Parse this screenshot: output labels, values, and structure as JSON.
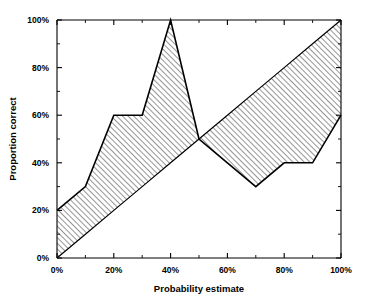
{
  "chart_data": {
    "type": "area",
    "title": "",
    "subtitle": "",
    "xlabel": "Probability estimate",
    "ylabel": "Proportion correct",
    "xlim": [
      0,
      100
    ],
    "ylim": [
      0,
      100
    ],
    "grid": false,
    "legend": "none",
    "x_tick_labels": [
      "0%",
      "20%",
      "40%",
      "60%",
      "80%",
      "100%"
    ],
    "x_tick_values": [
      0,
      20,
      40,
      60,
      80,
      100
    ],
    "x_minor_tick_values": [
      10,
      30,
      50,
      70,
      90
    ],
    "y_tick_labels": [
      "0%",
      "20%",
      "40%",
      "60%",
      "80%",
      "100%"
    ],
    "y_tick_values": [
      0,
      20,
      40,
      60,
      80,
      100
    ],
    "y_minor_tick_values": [
      10,
      30,
      50,
      70,
      90
    ],
    "x": [
      0,
      10,
      20,
      30,
      40,
      50,
      60,
      70,
      80,
      90,
      100
    ],
    "series": [
      {
        "name": "Proportion correct",
        "values": [
          20,
          30,
          60,
          60,
          100,
          50,
          40,
          30,
          40,
          40,
          60
        ]
      },
      {
        "name": "Perfect calibration",
        "values": [
          0,
          10,
          20,
          30,
          40,
          50,
          60,
          70,
          80,
          90,
          100
        ]
      }
    ],
    "annotations": [
      "Hatched region between observed proportion correct and the perfect-calibration diagonal"
    ]
  },
  "axes": {
    "x_title": "Probability estimate",
    "y_title": "Proportion correct"
  },
  "style": {
    "line_color": "#000000",
    "hatch_color": "#333333",
    "background": "#ffffff"
  }
}
